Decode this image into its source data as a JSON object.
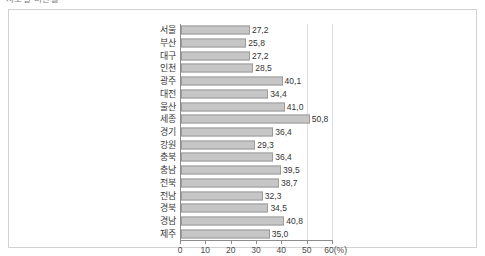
{
  "caption": {
    "text": "시도별 비만율"
  },
  "chart_data": {
    "type": "bar",
    "orientation": "horizontal",
    "title": "",
    "xlabel": "(%)",
    "ylabel": "",
    "grid": true,
    "legend": null,
    "xlim": [
      0,
      60
    ],
    "decimal_separator": ",",
    "categories": [
      "서울",
      "부산",
      "대구",
      "인천",
      "광주",
      "대전",
      "울산",
      "세종",
      "경기",
      "강원",
      "충북",
      "충남",
      "전북",
      "전남",
      "경북",
      "경남",
      "제주"
    ],
    "values": [
      27.2,
      25.8,
      27.2,
      28.5,
      40.1,
      34.4,
      41.0,
      50.8,
      36.4,
      29.3,
      36.4,
      39.5,
      38.7,
      32.3,
      34.5,
      40.8,
      35.0
    ],
    "value_labels": [
      "27,2",
      "25,8",
      "27,2",
      "28,5",
      "40,1",
      "34,4",
      "41,0",
      "50,8",
      "36,4",
      "29,3",
      "36,4",
      "39,5",
      "38,7",
      "32,3",
      "34,5",
      "40,8",
      "35,0"
    ],
    "xticks": [
      0,
      10,
      20,
      30,
      40,
      50,
      60
    ],
    "xtick_labels": [
      "0",
      "10",
      "20",
      "30",
      "40",
      "50",
      "60(%)"
    ],
    "gridline_values": [
      50,
      60
    ],
    "bar_color": "#c6c6c6",
    "bar_border_color": "#9b9b9b",
    "axis_color": "#8c8c8c",
    "grid_color": "#dcdcdc",
    "frame_color": "#d2d2d2"
  }
}
